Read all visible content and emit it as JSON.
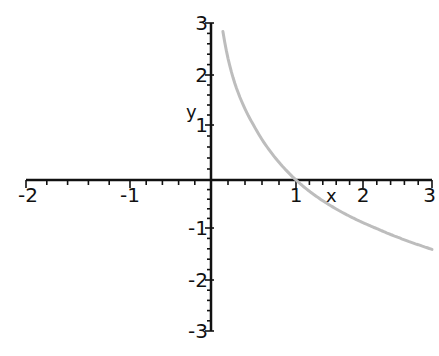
{
  "chart_data": {
    "type": "line",
    "title": "",
    "xlabel": "x",
    "ylabel": "y",
    "xlim": [
      -2,
      3
    ],
    "ylim": [
      -3,
      3
    ],
    "grid": false,
    "legend": null,
    "x_ticks": [
      {
        "value": -2,
        "label": "-2",
        "px": 26
      },
      {
        "value": -1,
        "label": "-1",
        "px": 130
      },
      {
        "value": 1,
        "label": "1",
        "px": 296
      },
      {
        "value": 2,
        "label": "2",
        "px": 363
      },
      {
        "value": 3,
        "label": "3",
        "px": 432
      }
    ],
    "y_ticks": [
      {
        "value": 3,
        "label": "3",
        "py": 23
      },
      {
        "value": 2,
        "label": "2",
        "py": 75
      },
      {
        "value": 1,
        "label": "1",
        "py": 125
      },
      {
        "value": -1,
        "label": "-1",
        "py": 228
      },
      {
        "value": -2,
        "label": "-2",
        "py": 280
      },
      {
        "value": -3,
        "label": "-3",
        "py": 331
      }
    ],
    "series": [
      {
        "name": "y = log_{1/2}(x)",
        "color": "#bdbdbd",
        "x": [
          0.14,
          0.2,
          0.3,
          0.4,
          0.5,
          0.6,
          0.75,
          0.9,
          1.0,
          1.25,
          1.5,
          1.75,
          2.0,
          2.25,
          2.5,
          2.75,
          3.0
        ],
        "y": [
          2.84,
          2.32,
          1.74,
          1.32,
          1.0,
          0.74,
          0.42,
          0.15,
          0.0,
          -0.32,
          -0.58,
          -0.81,
          -1.0,
          -1.17,
          -1.32,
          -1.46,
          -1.58
        ]
      }
    ]
  },
  "axes": {
    "x_label": "x",
    "y_label": "y",
    "axis_color": "#111111"
  }
}
